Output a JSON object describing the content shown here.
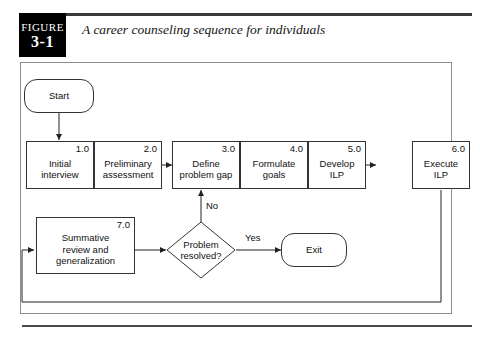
{
  "figure": {
    "badge_word": "FIGURE",
    "badge_number": "3-1",
    "title": "A career counseling sequence for individuals"
  },
  "flowchart": {
    "start_node": {
      "label": "Start"
    },
    "exit_node": {
      "label": "Exit"
    },
    "decision": {
      "label": "Problem\nresolved?"
    },
    "steps": [
      {
        "number": "1.0",
        "label": "Initial\ninterview"
      },
      {
        "number": "2.0",
        "label": "Preliminary\nassessment"
      },
      {
        "number": "3.0",
        "label": "Define\nproblem gap"
      },
      {
        "number": "4.0",
        "label": "Formulate\ngoals"
      },
      {
        "number": "5.0",
        "label": "Develop\nILP"
      },
      {
        "number": "6.0",
        "label": "Execute\nILP"
      },
      {
        "number": "7.0",
        "label": "Summative\nreview and\ngeneralization"
      }
    ],
    "edge_labels": {
      "no": "No",
      "yes": "Yes"
    }
  },
  "colors": {
    "badge_background": "#000000",
    "badge_text": "#ffffff",
    "rule": "#3a3a3a",
    "frame_border": "#8d8d8d",
    "node_border": "#333333",
    "node_fill": "#ffffff",
    "text": "#111111"
  }
}
